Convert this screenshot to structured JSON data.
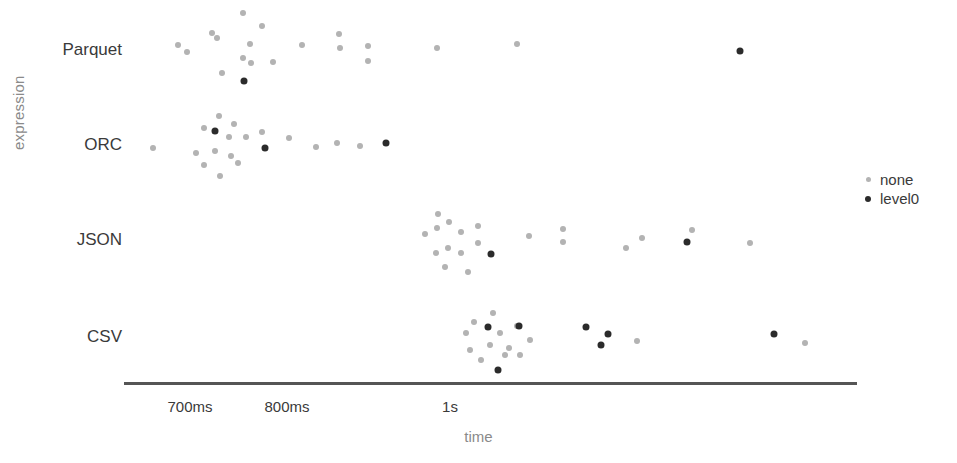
{
  "chart_data": {
    "type": "scatter",
    "title": "",
    "xlabel": "time",
    "ylabel": "expression",
    "grid": false,
    "legend_position": "right",
    "categories": [
      "Parquet",
      "ORC",
      "JSON",
      "CSV"
    ],
    "x_ticks": [
      {
        "label": "700ms",
        "value": 700,
        "px": 190
      },
      {
        "label": "800ms",
        "value": 800,
        "px": 287
      },
      {
        "label": "1s",
        "value": 1000,
        "px": 450
      }
    ],
    "xlim_px": [
      124,
      857
    ],
    "axis_units": "milliseconds",
    "series": [
      {
        "name": "none",
        "color": "#b3b3b3",
        "marker": "circle",
        "size": 6
      },
      {
        "name": "level0",
        "color": "#2b2b2b",
        "marker": "circle",
        "size": 7
      }
    ],
    "row_centers_px": {
      "Parquet": 50,
      "ORC": 145,
      "JSON": 240,
      "CSV": 337
    },
    "points": [
      {
        "category": "Parquet",
        "series": "none",
        "px": 178,
        "py": 45,
        "time_ms": 688
      },
      {
        "category": "Parquet",
        "series": "none",
        "px": 187,
        "py": 52,
        "time_ms": 697
      },
      {
        "category": "Parquet",
        "series": "none",
        "px": 212,
        "py": 33,
        "time_ms": 723
      },
      {
        "category": "Parquet",
        "series": "none",
        "px": 217,
        "py": 38,
        "time_ms": 728
      },
      {
        "category": "Parquet",
        "series": "none",
        "px": 243,
        "py": 13,
        "time_ms": 755
      },
      {
        "category": "Parquet",
        "series": "none",
        "px": 262,
        "py": 26,
        "time_ms": 775
      },
      {
        "category": "Parquet",
        "series": "none",
        "px": 250,
        "py": 44,
        "time_ms": 762
      },
      {
        "category": "Parquet",
        "series": "none",
        "px": 243,
        "py": 58,
        "time_ms": 755
      },
      {
        "category": "Parquet",
        "series": "none",
        "px": 251,
        "py": 63,
        "time_ms": 763
      },
      {
        "category": "Parquet",
        "series": "none",
        "px": 222,
        "py": 73,
        "time_ms": 733
      },
      {
        "category": "Parquet",
        "series": "none",
        "px": 273,
        "py": 62,
        "time_ms": 785
      },
      {
        "category": "Parquet",
        "series": "none",
        "px": 302,
        "py": 45,
        "time_ms": 815
      },
      {
        "category": "Parquet",
        "series": "none",
        "px": 339,
        "py": 34,
        "time_ms": 853
      },
      {
        "category": "Parquet",
        "series": "none",
        "px": 340,
        "py": 48,
        "time_ms": 854
      },
      {
        "category": "Parquet",
        "series": "none",
        "px": 368,
        "py": 46,
        "time_ms": 883
      },
      {
        "category": "Parquet",
        "series": "none",
        "px": 368,
        "py": 61,
        "time_ms": 883
      },
      {
        "category": "Parquet",
        "series": "none",
        "px": 437,
        "py": 48,
        "time_ms": 954
      },
      {
        "category": "Parquet",
        "series": "none",
        "px": 517,
        "py": 44,
        "time_ms": 1036
      },
      {
        "category": "Parquet",
        "series": "level0",
        "px": 244,
        "py": 81,
        "time_ms": 756
      },
      {
        "category": "Parquet",
        "series": "level0",
        "px": 740,
        "py": 51,
        "time_ms": 1266
      },
      {
        "category": "ORC",
        "series": "none",
        "px": 153,
        "py": 148,
        "time_ms": 662
      },
      {
        "category": "ORC",
        "series": "none",
        "px": 219,
        "py": 116,
        "time_ms": 729
      },
      {
        "category": "ORC",
        "series": "none",
        "px": 234,
        "py": 124,
        "time_ms": 745
      },
      {
        "category": "ORC",
        "series": "none",
        "px": 204,
        "py": 128,
        "time_ms": 714
      },
      {
        "category": "ORC",
        "series": "none",
        "px": 229,
        "py": 137,
        "time_ms": 740
      },
      {
        "category": "ORC",
        "series": "none",
        "px": 246,
        "py": 137,
        "time_ms": 757
      },
      {
        "category": "ORC",
        "series": "none",
        "px": 196,
        "py": 153,
        "time_ms": 706
      },
      {
        "category": "ORC",
        "series": "none",
        "px": 215,
        "py": 151,
        "time_ms": 725
      },
      {
        "category": "ORC",
        "series": "none",
        "px": 231,
        "py": 156,
        "time_ms": 742
      },
      {
        "category": "ORC",
        "series": "none",
        "px": 238,
        "py": 163,
        "time_ms": 749
      },
      {
        "category": "ORC",
        "series": "none",
        "px": 204,
        "py": 165,
        "time_ms": 714
      },
      {
        "category": "ORC",
        "series": "none",
        "px": 220,
        "py": 176,
        "time_ms": 730
      },
      {
        "category": "ORC",
        "series": "none",
        "px": 262,
        "py": 132,
        "time_ms": 773
      },
      {
        "category": "ORC",
        "series": "none",
        "px": 289,
        "py": 138,
        "time_ms": 801
      },
      {
        "category": "ORC",
        "series": "none",
        "px": 316,
        "py": 147,
        "time_ms": 828
      },
      {
        "category": "ORC",
        "series": "none",
        "px": 337,
        "py": 143,
        "time_ms": 850
      },
      {
        "category": "ORC",
        "series": "none",
        "px": 360,
        "py": 146,
        "time_ms": 873
      },
      {
        "category": "ORC",
        "series": "level0",
        "px": 215,
        "py": 131,
        "time_ms": 725
      },
      {
        "category": "ORC",
        "series": "level0",
        "px": 265,
        "py": 148,
        "time_ms": 776
      },
      {
        "category": "ORC",
        "series": "level0",
        "px": 386,
        "py": 143,
        "time_ms": 900
      },
      {
        "category": "JSON",
        "series": "none",
        "px": 438,
        "py": 214,
        "time_ms": 955
      },
      {
        "category": "JSON",
        "series": "none",
        "px": 437,
        "py": 228,
        "time_ms": 954
      },
      {
        "category": "JSON",
        "series": "none",
        "px": 449,
        "py": 222,
        "time_ms": 967
      },
      {
        "category": "JSON",
        "series": "none",
        "px": 425,
        "py": 234,
        "time_ms": 942
      },
      {
        "category": "JSON",
        "series": "none",
        "px": 461,
        "py": 232,
        "time_ms": 979
      },
      {
        "category": "JSON",
        "series": "none",
        "px": 478,
        "py": 226,
        "time_ms": 996
      },
      {
        "category": "JSON",
        "series": "none",
        "px": 448,
        "py": 248,
        "time_ms": 966
      },
      {
        "category": "JSON",
        "series": "none",
        "px": 436,
        "py": 253,
        "time_ms": 953
      },
      {
        "category": "JSON",
        "series": "none",
        "px": 478,
        "py": 243,
        "time_ms": 996
      },
      {
        "category": "JSON",
        "series": "none",
        "px": 461,
        "py": 253,
        "time_ms": 979
      },
      {
        "category": "JSON",
        "series": "none",
        "px": 445,
        "py": 267,
        "time_ms": 963
      },
      {
        "category": "JSON",
        "series": "none",
        "px": 468,
        "py": 272,
        "time_ms": 987
      },
      {
        "category": "JSON",
        "series": "none",
        "px": 529,
        "py": 236,
        "time_ms": 1049
      },
      {
        "category": "JSON",
        "series": "none",
        "px": 563,
        "py": 229,
        "time_ms": 1084
      },
      {
        "category": "JSON",
        "series": "none",
        "px": 563,
        "py": 242,
        "time_ms": 1084
      },
      {
        "category": "JSON",
        "series": "none",
        "px": 626,
        "py": 248,
        "time_ms": 1149
      },
      {
        "category": "JSON",
        "series": "none",
        "px": 642,
        "py": 238,
        "time_ms": 1165
      },
      {
        "category": "JSON",
        "series": "none",
        "px": 692,
        "py": 230,
        "time_ms": 1216
      },
      {
        "category": "JSON",
        "series": "none",
        "px": 750,
        "py": 243,
        "time_ms": 1276
      },
      {
        "category": "JSON",
        "series": "level0",
        "px": 491,
        "py": 254,
        "time_ms": 1009
      },
      {
        "category": "JSON",
        "series": "level0",
        "px": 687,
        "py": 242,
        "time_ms": 1211
      },
      {
        "category": "CSV",
        "series": "none",
        "px": 493,
        "py": 313,
        "time_ms": 1011
      },
      {
        "category": "CSV",
        "series": "none",
        "px": 474,
        "py": 322,
        "time_ms": 992
      },
      {
        "category": "CSV",
        "series": "none",
        "px": 517,
        "py": 326,
        "time_ms": 1035
      },
      {
        "category": "CSV",
        "series": "none",
        "px": 500,
        "py": 333,
        "time_ms": 1018
      },
      {
        "category": "CSV",
        "series": "none",
        "px": 466,
        "py": 333,
        "time_ms": 984
      },
      {
        "category": "CSV",
        "series": "none",
        "px": 530,
        "py": 340,
        "time_ms": 1049
      },
      {
        "category": "CSV",
        "series": "none",
        "px": 490,
        "py": 345,
        "time_ms": 1008
      },
      {
        "category": "CSV",
        "series": "none",
        "px": 470,
        "py": 350,
        "time_ms": 988
      },
      {
        "category": "CSV",
        "series": "none",
        "px": 509,
        "py": 348,
        "time_ms": 1027
      },
      {
        "category": "CSV",
        "series": "none",
        "px": 520,
        "py": 355,
        "time_ms": 1039
      },
      {
        "category": "CSV",
        "series": "none",
        "px": 505,
        "py": 355,
        "time_ms": 1023
      },
      {
        "category": "CSV",
        "series": "none",
        "px": 481,
        "py": 360,
        "time_ms": 999
      },
      {
        "category": "CSV",
        "series": "none",
        "px": 637,
        "py": 341,
        "time_ms": 1160
      },
      {
        "category": "CSV",
        "series": "none",
        "px": 805,
        "py": 343,
        "time_ms": 1335
      },
      {
        "category": "CSV",
        "series": "level0",
        "px": 488,
        "py": 327,
        "time_ms": 1006
      },
      {
        "category": "CSV",
        "series": "level0",
        "px": 519,
        "py": 326,
        "time_ms": 1037
      },
      {
        "category": "CSV",
        "series": "level0",
        "px": 586,
        "py": 327,
        "time_ms": 1107
      },
      {
        "category": "CSV",
        "series": "level0",
        "px": 608,
        "py": 334,
        "time_ms": 1130
      },
      {
        "category": "CSV",
        "series": "level0",
        "px": 601,
        "py": 345,
        "time_ms": 1123
      },
      {
        "category": "CSV",
        "series": "level0",
        "px": 498,
        "py": 370,
        "time_ms": 1018
      },
      {
        "category": "CSV",
        "series": "level0",
        "px": 774,
        "py": 334,
        "time_ms": 1302
      }
    ]
  },
  "legend": {
    "items": [
      {
        "label": "none",
        "marker": "none-dot-icon"
      },
      {
        "label": "level0",
        "marker": "level0-dot-icon"
      }
    ]
  },
  "colors": {
    "none": "#b3b3b3",
    "level0": "#2b2b2b",
    "axis": "#555555",
    "text": "#3a3a3a",
    "muted_text": "#8a8a8a",
    "background": "#ffffff"
  }
}
